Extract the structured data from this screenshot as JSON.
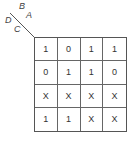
{
  "kmap": {
    "labels": {
      "top_left": "B",
      "top_right": "A",
      "bottom_left": "D",
      "bottom_right": "C"
    },
    "cells": [
      [
        "1",
        "0",
        "1",
        "1"
      ],
      [
        "0",
        "1",
        "1",
        "0"
      ],
      [
        "X",
        "X",
        "X",
        "X"
      ],
      [
        "1",
        "1",
        "X",
        "X"
      ]
    ]
  }
}
